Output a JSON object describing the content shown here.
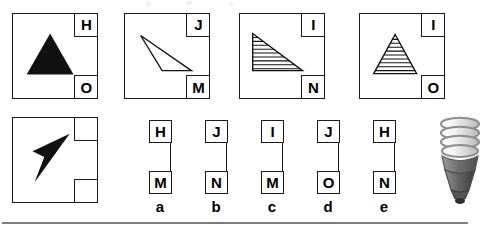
{
  "meta": {
    "kind": "visual-analogy-multiple-choice-question",
    "background": "#ffffff",
    "ink": "#1a1a1a",
    "rule_color": "#7d7d7d"
  },
  "stimulus": {
    "caption": "",
    "panels": [
      {
        "id": "panel-1",
        "top_label": "H",
        "bottom_label": "O",
        "figure": "filled-isoceles-triangle",
        "fill": "solid-black",
        "orientation": "up"
      },
      {
        "id": "panel-2",
        "top_label": "J",
        "bottom_label": "M",
        "figure": "outline-scalene-triangle",
        "fill": "none",
        "orientation": "right"
      },
      {
        "id": "panel-3",
        "top_label": "I",
        "bottom_label": "N",
        "figure": "hatched-right-triangle",
        "fill": "horizontal-hatch",
        "orientation": "right"
      },
      {
        "id": "panel-4",
        "top_label": "I",
        "bottom_label": "O",
        "figure": "hatched-isoceles-triangle",
        "fill": "horizontal-hatch",
        "orientation": "up"
      }
    ]
  },
  "question": {
    "id": "panel-question",
    "top_label": "",
    "bottom_label": "",
    "figure": "filled-dart-arrow",
    "fill": "solid-black",
    "orientation": "right"
  },
  "options": [
    {
      "key": "a",
      "top": "H",
      "bottom": "M"
    },
    {
      "key": "b",
      "top": "J",
      "bottom": "N"
    },
    {
      "key": "c",
      "top": "I",
      "bottom": "M"
    },
    {
      "key": "d",
      "top": "J",
      "bottom": "O"
    },
    {
      "key": "e",
      "top": "H",
      "bottom": "N"
    }
  ],
  "decoration": {
    "bulb": "compact-fluorescent-bulb-icon"
  }
}
